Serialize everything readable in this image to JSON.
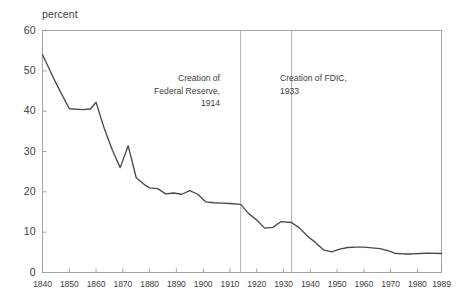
{
  "chart_data": {
    "type": "line",
    "title": "",
    "xlabel": "",
    "ylabel": "percent",
    "xlim": [
      1840,
      1989
    ],
    "ylim": [
      0,
      60
    ],
    "grid": false,
    "legend": "none",
    "y_ticks": [
      0,
      10,
      20,
      30,
      40,
      50,
      60
    ],
    "x_ticks": [
      1840,
      1850,
      1860,
      1870,
      1880,
      1890,
      1900,
      1910,
      1920,
      1930,
      1940,
      1950,
      1960,
      1970,
      1980,
      1989
    ],
    "x_tick_labels": [
      "1840",
      "1850",
      "1860",
      "1870",
      "1880",
      "1890",
      "1900",
      "1910",
      "1920",
      "1930",
      "1940",
      "1950",
      "1960",
      "1970",
      "1980",
      "1989"
    ],
    "series": [
      {
        "name": "percent",
        "color": "#4a4a4a",
        "x": [
          1840,
          1845,
          1850,
          1855,
          1858,
          1860,
          1863,
          1866,
          1869,
          1872,
          1875,
          1878,
          1880,
          1883,
          1886,
          1889,
          1892,
          1895,
          1898,
          1901,
          1904,
          1907,
          1910,
          1914,
          1917,
          1920,
          1923,
          1926,
          1929,
          1933,
          1936,
          1939,
          1942,
          1945,
          1948,
          1951,
          1954,
          1957,
          1960,
          1963,
          1966,
          1969,
          1972,
          1975,
          1978,
          1981,
          1984,
          1989
        ],
        "y": [
          54.0,
          47.0,
          40.6,
          40.4,
          40.6,
          42.2,
          35.8,
          30.5,
          26.0,
          31.4,
          23.5,
          21.8,
          21.0,
          20.8,
          19.5,
          19.7,
          19.4,
          20.3,
          19.4,
          17.5,
          17.3,
          17.2,
          17.1,
          16.9,
          14.6,
          13.0,
          11.0,
          11.2,
          12.6,
          12.4,
          11.0,
          9.0,
          7.4,
          5.6,
          5.1,
          5.8,
          6.2,
          6.3,
          6.3,
          6.1,
          5.9,
          5.4,
          4.7,
          4.6,
          4.6,
          4.7,
          4.8,
          4.7
        ]
      }
    ],
    "annotations": [
      {
        "id": "fed",
        "text": "Creation of\nFederal Reserve,\n1914",
        "marker_x": 1914,
        "align": "right"
      },
      {
        "id": "fdic",
        "text": "Creation of FDIC,\n1933",
        "marker_x": 1933,
        "align": "left"
      }
    ]
  },
  "axis": {
    "y_title": "percent"
  }
}
